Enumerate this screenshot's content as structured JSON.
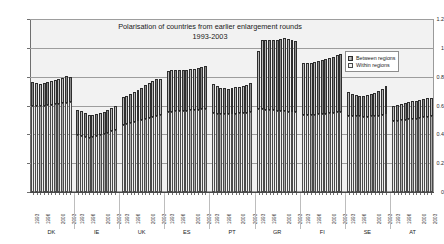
{
  "chart_data": {
    "type": "bar",
    "subtype": "stacked-bar",
    "title": "Polarisation of countries from earlier enlargement rounds",
    "subtitle": "1993-2003",
    "xlabel": "",
    "ylabel": "",
    "ylim": [
      0,
      1.2
    ],
    "ytick_values": [
      0,
      0.2,
      0.4,
      0.6,
      0.8,
      1,
      1.2
    ],
    "ytick_labels": [
      "0",
      "0.2",
      "0.4",
      "0.6",
      "0.8",
      "1",
      "1.2"
    ],
    "grid": true,
    "legend_position": "top-right",
    "legend": [
      "Between regions",
      "Within regions"
    ],
    "x": [
      "1993",
      "1994",
      "1995",
      "1996",
      "1997",
      "1998",
      "1999",
      "2000",
      "2001",
      "2002",
      "2003"
    ],
    "tick_label_years": [
      "1993",
      "1996",
      "2000",
      "2003"
    ],
    "groups": [
      "DK",
      "IE",
      "UK",
      "ES",
      "PT",
      "GR",
      "FI",
      "SE",
      "AT"
    ],
    "series": [
      {
        "name": "Within regions",
        "color": "#ececec",
        "values_by_group": {
          "DK": [
            0.598,
            0.596,
            0.597,
            0.6,
            0.603,
            0.605,
            0.608,
            0.611,
            0.615,
            0.62,
            0.627
          ],
          "IE": [
            0.395,
            0.39,
            0.383,
            0.378,
            0.381,
            0.387,
            0.394,
            0.402,
            0.41,
            0.42,
            0.432
          ],
          "UK": [
            0.468,
            0.472,
            0.478,
            0.484,
            0.49,
            0.497,
            0.503,
            0.51,
            0.517,
            0.524,
            0.532
          ],
          "ES": [
            0.557,
            0.558,
            0.56,
            0.561,
            0.563,
            0.565,
            0.567,
            0.569,
            0.571,
            0.574,
            0.577
          ],
          "PT": [
            0.545,
            0.543,
            0.541,
            0.54,
            0.54,
            0.541,
            0.543,
            0.545,
            0.548,
            0.551,
            0.556
          ],
          "GR": [
            0.576,
            0.574,
            0.571,
            0.569,
            0.566,
            0.564,
            0.562,
            0.56,
            0.558,
            0.556,
            0.554
          ],
          "FI": [
            0.532,
            0.533,
            0.534,
            0.536,
            0.538,
            0.54,
            0.542,
            0.545,
            0.548,
            0.552,
            0.556
          ],
          "SE": [
            0.53,
            0.528,
            0.526,
            0.524,
            0.523,
            0.523,
            0.524,
            0.526,
            0.529,
            0.533,
            0.538
          ],
          "AT": [
            0.493,
            0.495,
            0.497,
            0.5,
            0.503,
            0.506,
            0.509,
            0.513,
            0.517,
            0.521,
            0.526
          ]
        }
      },
      {
        "name": "Between regions",
        "color": "#8a8a8a",
        "values_by_group": {
          "DK": [
            0.164,
            0.158,
            0.155,
            0.158,
            0.162,
            0.166,
            0.17,
            0.175,
            0.178,
            0.182,
            0.171
          ],
          "IE": [
            0.175,
            0.172,
            0.166,
            0.158,
            0.154,
            0.152,
            0.153,
            0.156,
            0.16,
            0.164,
            0.166
          ],
          "UK": [
            0.192,
            0.197,
            0.204,
            0.212,
            0.22,
            0.228,
            0.237,
            0.246,
            0.253,
            0.258,
            0.252
          ],
          "ES": [
            0.284,
            0.286,
            0.285,
            0.283,
            0.281,
            0.281,
            0.283,
            0.285,
            0.288,
            0.292,
            0.298
          ],
          "PT": [
            0.204,
            0.194,
            0.184,
            0.179,
            0.178,
            0.18,
            0.182,
            0.185,
            0.189,
            0.193,
            0.198
          ],
          "GR": [
            0.4,
            0.478,
            0.484,
            0.487,
            0.489,
            0.492,
            0.5,
            0.508,
            0.504,
            0.497,
            0.494
          ],
          "FI": [
            0.36,
            0.361,
            0.364,
            0.368,
            0.372,
            0.376,
            0.38,
            0.386,
            0.392,
            0.4,
            0.404
          ],
          "SE": [
            0.162,
            0.152,
            0.146,
            0.143,
            0.145,
            0.15,
            0.156,
            0.164,
            0.172,
            0.183,
            0.2
          ],
          "AT": [
            0.107,
            0.11,
            0.113,
            0.116,
            0.119,
            0.122,
            0.125,
            0.128,
            0.131,
            0.134,
            0.125
          ]
        }
      }
    ],
    "totals_by_group": {
      "DK": [
        0.762,
        0.754,
        0.752,
        0.758,
        0.765,
        0.771,
        0.778,
        0.786,
        0.793,
        0.802,
        0.798
      ],
      "IE": [
        0.57,
        0.562,
        0.549,
        0.536,
        0.535,
        0.539,
        0.547,
        0.558,
        0.57,
        0.584,
        0.598
      ],
      "UK": [
        0.66,
        0.669,
        0.682,
        0.696,
        0.71,
        0.725,
        0.74,
        0.756,
        0.77,
        0.782,
        0.784
      ],
      "ES": [
        0.841,
        0.844,
        0.845,
        0.844,
        0.844,
        0.846,
        0.85,
        0.854,
        0.859,
        0.866,
        0.875
      ],
      "PT": [
        0.749,
        0.737,
        0.725,
        0.719,
        0.718,
        0.721,
        0.725,
        0.73,
        0.737,
        0.744,
        0.754
      ],
      "GR": [
        0.976,
        1.052,
        1.055,
        1.056,
        1.055,
        1.056,
        1.062,
        1.068,
        1.062,
        1.053,
        1.048
      ],
      "FI": [
        0.892,
        0.894,
        0.898,
        0.904,
        0.91,
        0.916,
        0.922,
        0.931,
        0.94,
        0.952,
        0.96
      ],
      "SE": [
        0.692,
        0.68,
        0.672,
        0.667,
        0.668,
        0.673,
        0.68,
        0.69,
        0.701,
        0.716,
        0.738
      ],
      "AT": [
        0.6,
        0.605,
        0.61,
        0.616,
        0.622,
        0.628,
        0.634,
        0.641,
        0.648,
        0.655,
        0.651
      ]
    }
  }
}
